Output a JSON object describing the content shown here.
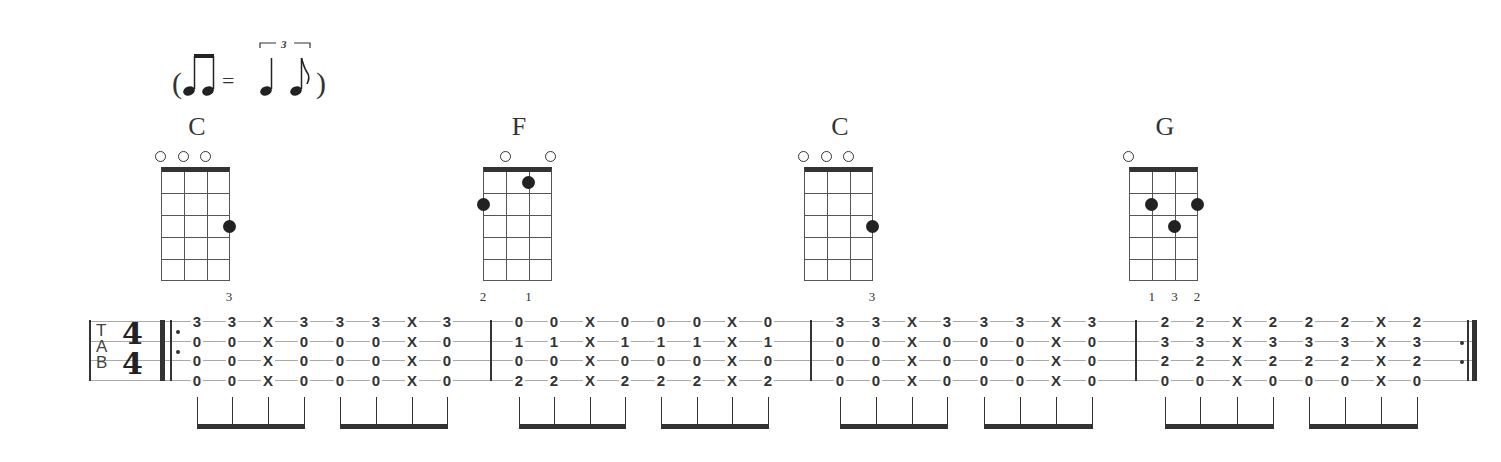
{
  "swing_notation": {
    "open_paren": "(",
    "equals": "=",
    "close_paren": ")",
    "triplet_number": "3"
  },
  "chords": [
    {
      "name": "C",
      "x": 197,
      "open_strings": [
        0,
        1,
        2
      ],
      "dots": [
        {
          "string": 3,
          "fret": 3
        }
      ],
      "fingers": [
        {
          "string": 3,
          "label": "3"
        }
      ]
    },
    {
      "name": "F",
      "x": 519,
      "open_strings": [
        1,
        3
      ],
      "dots": [
        {
          "string": 0,
          "fret": 2
        },
        {
          "string": 2,
          "fret": 1
        }
      ],
      "fingers": [
        {
          "string": 0,
          "label": "2"
        },
        {
          "string": 2,
          "label": "1"
        }
      ]
    },
    {
      "name": "C",
      "x": 840,
      "open_strings": [
        0,
        1,
        2
      ],
      "dots": [
        {
          "string": 3,
          "fret": 3
        }
      ],
      "fingers": [
        {
          "string": 3,
          "label": "3"
        }
      ]
    },
    {
      "name": "G",
      "x": 1165,
      "open_strings": [
        0
      ],
      "dots": [
        {
          "string": 1,
          "fret": 2
        },
        {
          "string": 2,
          "fret": 3
        },
        {
          "string": 3,
          "fret": 2
        }
      ],
      "fingers": [
        {
          "string": 1,
          "label": "1"
        },
        {
          "string": 2,
          "label": "3"
        },
        {
          "string": 3,
          "label": "2"
        }
      ]
    }
  ],
  "tab": {
    "clef": [
      "T",
      "A",
      "B"
    ],
    "time_signature": {
      "top": "4",
      "bottom": "4"
    },
    "measures": [
      {
        "chord": "C",
        "columns": [
          [
            "3",
            "0",
            "0",
            "0"
          ],
          [
            "3",
            "0",
            "0",
            "0"
          ],
          [
            "X",
            "X",
            "X",
            "X"
          ],
          [
            "3",
            "0",
            "0",
            "0"
          ],
          [
            "3",
            "0",
            "0",
            "0"
          ],
          [
            "3",
            "0",
            "0",
            "0"
          ],
          [
            "X",
            "X",
            "X",
            "X"
          ],
          [
            "3",
            "0",
            "0",
            "0"
          ]
        ]
      },
      {
        "chord": "F",
        "columns": [
          [
            "0",
            "1",
            "0",
            "2"
          ],
          [
            "0",
            "1",
            "0",
            "2"
          ],
          [
            "X",
            "X",
            "X",
            "X"
          ],
          [
            "0",
            "1",
            "0",
            "2"
          ],
          [
            "0",
            "1",
            "0",
            "2"
          ],
          [
            "0",
            "1",
            "0",
            "2"
          ],
          [
            "X",
            "X",
            "X",
            "X"
          ],
          [
            "0",
            "1",
            "0",
            "2"
          ]
        ]
      },
      {
        "chord": "C",
        "columns": [
          [
            "3",
            "0",
            "0",
            "0"
          ],
          [
            "3",
            "0",
            "0",
            "0"
          ],
          [
            "X",
            "X",
            "X",
            "X"
          ],
          [
            "3",
            "0",
            "0",
            "0"
          ],
          [
            "3",
            "0",
            "0",
            "0"
          ],
          [
            "3",
            "0",
            "0",
            "0"
          ],
          [
            "X",
            "X",
            "X",
            "X"
          ],
          [
            "3",
            "0",
            "0",
            "0"
          ]
        ]
      },
      {
        "chord": "G",
        "columns": [
          [
            "2",
            "3",
            "2",
            "0"
          ],
          [
            "2",
            "3",
            "2",
            "0"
          ],
          [
            "X",
            "X",
            "X",
            "X"
          ],
          [
            "2",
            "3",
            "2",
            "0"
          ],
          [
            "2",
            "3",
            "2",
            "0"
          ],
          [
            "2",
            "3",
            "2",
            "0"
          ],
          [
            "X",
            "X",
            "X",
            "X"
          ],
          [
            "2",
            "3",
            "2",
            "0"
          ]
        ]
      }
    ],
    "column_x": [
      [
        197,
        232,
        268,
        304,
        340,
        376,
        412,
        447
      ],
      [
        519,
        554,
        590,
        625,
        661,
        697,
        732,
        768
      ],
      [
        840,
        876,
        912,
        947,
        984,
        1020,
        1056,
        1092
      ],
      [
        1165,
        1200,
        1237,
        1273,
        1309,
        1345,
        1381,
        1417
      ]
    ],
    "barlines_x": [
      490,
      810,
      1135
    ]
  }
}
